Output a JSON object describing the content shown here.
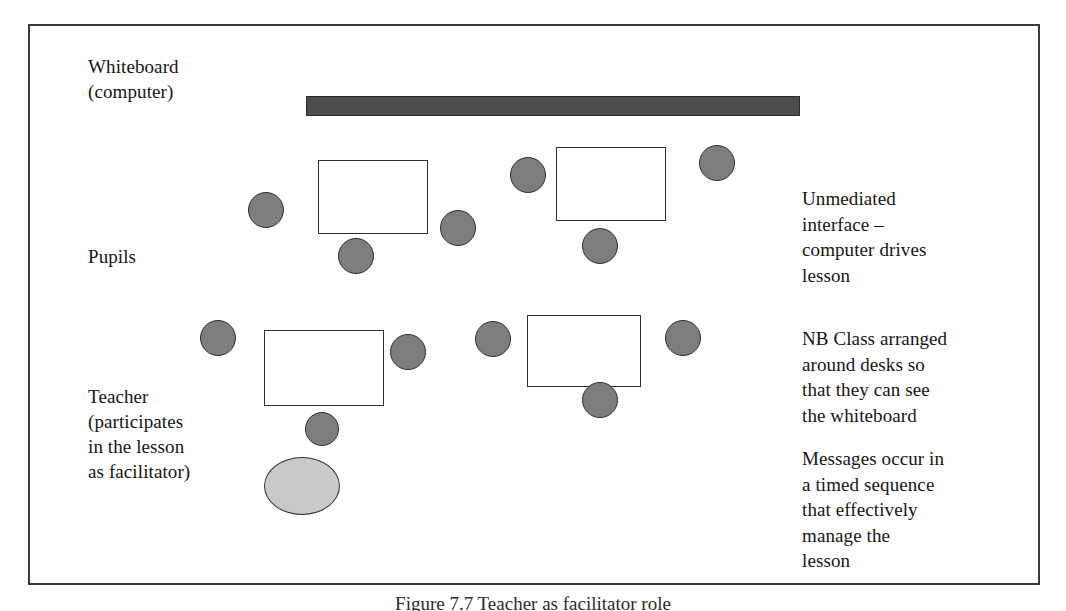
{
  "figure": {
    "caption": "Figure 7.7  Teacher as facilitator role",
    "border_color": "#3a3a3a",
    "background": "#ffffff"
  },
  "labels": {
    "whiteboard": "Whiteboard\n(computer)",
    "pupils": "Pupils",
    "teacher": "Teacher\n(participates\nin the lesson\nas facilitator)"
  },
  "notes": {
    "unmediated": "Unmediated\ninterface –\ncomputer drives\nlesson",
    "arrangement": "NB Class arranged\naround desks so\nthat they can see\nthe whiteboard",
    "messages": "Messages occur in\na timed sequence\nthat effectively\nmanage the\nlesson"
  },
  "colors": {
    "whiteboard_fill": "#4d4d4d",
    "pupil_fill": "#7d7d7d",
    "teacher_fill": "#c9c9c9",
    "desk_fill": "#ffffff",
    "outline": "#303030"
  },
  "shapes": {
    "whiteboard": {
      "x": 276,
      "y": 70,
      "w": 494,
      "h": 20
    },
    "desks": [
      {
        "name": "desk-top-left",
        "x": 316,
        "y": 158,
        "w": 110,
        "h": 74
      },
      {
        "name": "desk-top-right",
        "x": 554,
        "y": 145,
        "w": 110,
        "h": 74
      },
      {
        "name": "desk-bottom-left",
        "x": 262,
        "y": 328,
        "w": 120,
        "h": 76
      },
      {
        "name": "desk-bottom-right",
        "x": 525,
        "y": 313,
        "w": 114,
        "h": 72
      }
    ],
    "pupils": [
      {
        "name": "pupil-1",
        "x": 246,
        "y": 190,
        "d": 36
      },
      {
        "name": "pupil-2",
        "x": 336,
        "y": 236,
        "d": 36
      },
      {
        "name": "pupil-3",
        "x": 438,
        "y": 208,
        "d": 36
      },
      {
        "name": "pupil-4",
        "x": 508,
        "y": 155,
        "d": 36
      },
      {
        "name": "pupil-5",
        "x": 580,
        "y": 226,
        "d": 36
      },
      {
        "name": "pupil-6",
        "x": 697,
        "y": 143,
        "d": 36
      },
      {
        "name": "pupil-7",
        "x": 198,
        "y": 318,
        "d": 36
      },
      {
        "name": "pupil-8",
        "x": 388,
        "y": 332,
        "d": 36
      },
      {
        "name": "pupil-9",
        "x": 303,
        "y": 410,
        "d": 34
      },
      {
        "name": "pupil-10",
        "x": 473,
        "y": 319,
        "d": 36
      },
      {
        "name": "pupil-11",
        "x": 580,
        "y": 380,
        "d": 36
      },
      {
        "name": "pupil-12",
        "x": 663,
        "y": 318,
        "d": 36
      }
    ],
    "teacher": {
      "x": 262,
      "y": 455,
      "w": 76,
      "h": 58
    }
  }
}
